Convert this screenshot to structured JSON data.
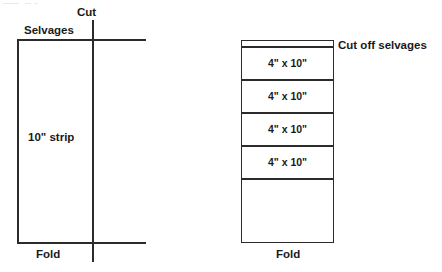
{
  "figure": {
    "background_color": "#ffffff",
    "line_color": "#2b2b2b",
    "text_color": "#1a1a1a"
  },
  "left_diagram": {
    "name": "folded-fabric-before-cutting",
    "labels": {
      "cut": "Cut",
      "selvages": "Selvages",
      "strip": "10\" strip",
      "fold": "Fold"
    }
  },
  "right_diagram": {
    "name": "strip-subcut-into-pieces",
    "labels": {
      "cut_off_selvages": "Cut off selvages",
      "fold": "Fold"
    },
    "cells": [
      {
        "label": "4\" x 10\""
      },
      {
        "label": "4\" x 10\""
      },
      {
        "label": "4\" x 10\""
      },
      {
        "label": "4\" x 10\""
      },
      {
        "label": ""
      }
    ]
  }
}
